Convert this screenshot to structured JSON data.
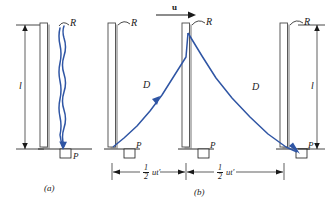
{
  "figure": {
    "panels": [
      {
        "id": "a",
        "caption": "(a)",
        "description": "Light clock at rest: beam travels straight up and back down",
        "labels": {
          "mirror_top": "R",
          "detector": "P",
          "height": "l"
        }
      },
      {
        "id": "b",
        "caption": "(b)",
        "description": "Light clock moving with velocity u: beam travels diagonal path",
        "labels": {
          "velocity": "u",
          "mirror_top_left": "R",
          "mirror_top_mid": "R",
          "mirror_top_right": "R",
          "detector_left": "P",
          "detector_mid": "P",
          "detector_right": "P",
          "diagonal_left": "D",
          "diagonal_right": "D",
          "height": "l",
          "distance_left_num": "1",
          "distance_left_den": "2",
          "distance_left_rest": "ut′",
          "distance_right_num": "1",
          "distance_right_den": "2",
          "distance_right_rest": "ut′"
        }
      }
    ],
    "colors": {
      "beam": "#2f55a4",
      "ink": "#1a1a1a",
      "mirror_fill": "#ffffff",
      "mirror_stroke": "#4a4a4a",
      "shadow": "#888888"
    }
  }
}
